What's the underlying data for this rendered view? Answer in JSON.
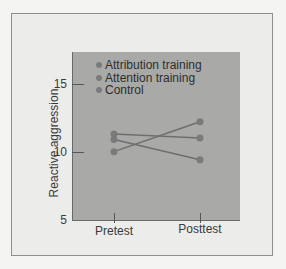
{
  "chart_data": {
    "type": "line",
    "title": "",
    "xlabel": "",
    "ylabel": "Reactive aggression",
    "categories": [
      "Pretest",
      "Posttest"
    ],
    "series": [
      {
        "name": "Attribution training",
        "values": [
          10.1,
          12.3
        ]
      },
      {
        "name": "Attention training",
        "values": [
          11.4,
          11.1
        ]
      },
      {
        "name": "Control",
        "values": [
          11.0,
          9.5
        ]
      }
    ],
    "ylim": [
      5,
      17.5
    ],
    "yticks": [
      5,
      10,
      15
    ],
    "grid": false,
    "legend_position": "top-left inside"
  },
  "axis": {
    "ylabel": "Reactive aggression",
    "yticks": [
      "15",
      "10",
      "5"
    ],
    "xticks": [
      "Pretest",
      "Posttest"
    ]
  },
  "legend": {
    "items": [
      "Attribution training",
      "Attention training",
      "Control"
    ]
  },
  "colors": {
    "plot_bg": "#a9a9a7",
    "line": "#6e6e6e",
    "marker": "#7a7a7a"
  }
}
